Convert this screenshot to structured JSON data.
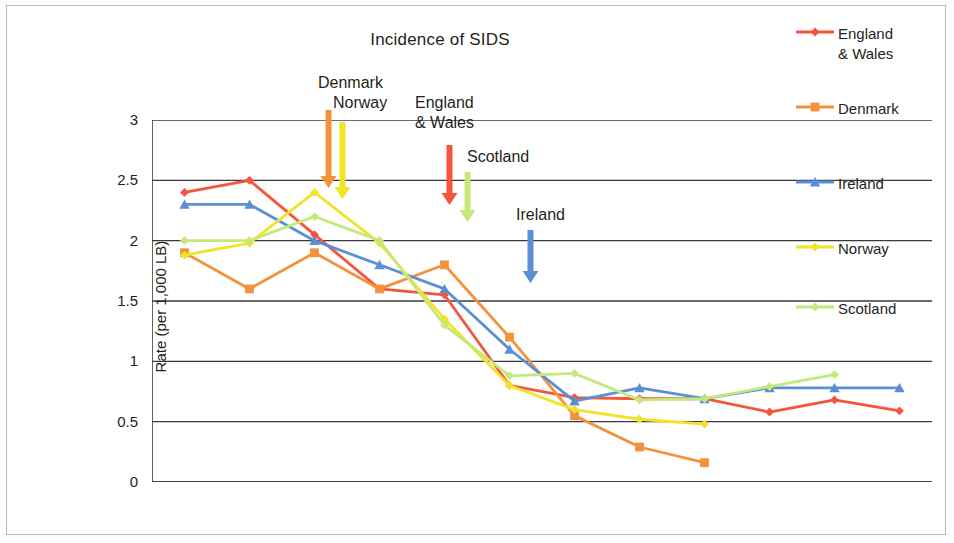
{
  "chart_data": {
    "type": "line",
    "title": "Incidence of SIDS",
    "xlabel": "",
    "ylabel": "Rate (per 1,000 LB)",
    "x": [
      1987,
      1988,
      1989,
      1990,
      1991,
      1992,
      1993,
      1994,
      1995,
      1996,
      1997,
      1998
    ],
    "xlim": [
      1986.5,
      1998.5
    ],
    "ylim": [
      0,
      3
    ],
    "yticks": [
      0,
      0.5,
      1,
      1.5,
      2,
      2.5,
      3
    ],
    "ytick_labels": [
      "0",
      "0.5",
      "1",
      "1.5",
      "2",
      "2.5",
      "3"
    ],
    "xticks": [
      1987,
      1990,
      1993,
      1996
    ],
    "xtick_labels": [
      "1987",
      "1990",
      "1993",
      "1996"
    ],
    "grid": "horizontal",
    "legend_position": "right",
    "series": [
      {
        "name": "England\n& Wales",
        "legend_label": "England\n& Wales",
        "color": "#f4553c",
        "marker": "diamond",
        "values": [
          2.4,
          2.5,
          2.05,
          1.6,
          1.55,
          0.8,
          0.7,
          0.69,
          0.69,
          0.58,
          0.68,
          0.59
        ]
      },
      {
        "name": "Denmark",
        "legend_label": "Denmark",
        "color": "#f4923c",
        "marker": "square",
        "values": [
          1.9,
          1.6,
          1.9,
          1.6,
          1.8,
          1.2,
          0.55,
          0.29,
          0.16,
          null,
          null,
          null
        ]
      },
      {
        "name": "Ireland",
        "legend_label": "Ireland",
        "color": "#5b8fd4",
        "marker": "triangle",
        "values": [
          2.3,
          2.3,
          2.0,
          1.8,
          1.6,
          1.1,
          0.67,
          0.78,
          0.69,
          0.78,
          0.78,
          0.78
        ]
      },
      {
        "name": "Norway",
        "legend_label": "Norway",
        "color": "#f2e329",
        "marker": "diamond",
        "values": [
          1.88,
          1.98,
          2.4,
          1.98,
          1.35,
          0.8,
          0.6,
          0.52,
          0.48,
          null,
          null,
          null
        ]
      },
      {
        "name": "Scotland",
        "legend_label": "Scotland",
        "color": "#c4e97a",
        "marker": "diamond",
        "values": [
          2.0,
          2.0,
          2.2,
          2.0,
          1.3,
          0.88,
          0.9,
          0.68,
          0.69,
          0.79,
          0.89,
          null
        ]
      }
    ],
    "annotations": [
      {
        "label": "Denmark",
        "text_x": 318,
        "text_y": 73,
        "arrow_x": 328,
        "arrow_top": 110,
        "arrow_bottom": 188,
        "color": "#f4923c"
      },
      {
        "label": "Norway",
        "text_x": 333,
        "text_y": 93,
        "arrow_x": 342,
        "arrow_top": 122,
        "arrow_bottom": 199,
        "color": "#f2e329"
      },
      {
        "label": "England\n& Wales",
        "text_x": 415,
        "text_y": 93,
        "arrow_x": 449,
        "arrow_top": 145,
        "arrow_bottom": 205,
        "color": "#f4553c"
      },
      {
        "label": "Scotland",
        "text_x": 467,
        "text_y": 147,
        "arrow_x": 467,
        "arrow_top": 172,
        "arrow_bottom": 222,
        "color": "#c4e97a"
      },
      {
        "label": "Ireland",
        "text_x": 516,
        "text_y": 205,
        "arrow_x": 530,
        "arrow_top": 230,
        "arrow_bottom": 283,
        "color": "#5b8fd4"
      }
    ]
  }
}
